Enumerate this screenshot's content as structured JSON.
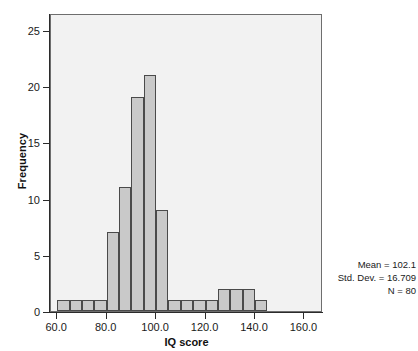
{
  "chart_data": {
    "type": "bar",
    "title": "",
    "subtitle": "",
    "xlabel": "IQ score",
    "ylabel": "Frequency",
    "xlim": [
      57.5,
      167.5
    ],
    "ylim": [
      0,
      26.5
    ],
    "bin_width": 5,
    "grid": false,
    "legend": null,
    "x_ticks": [
      "60.0",
      "80.0",
      "100.0",
      "120.0",
      "140.0",
      "160.0"
    ],
    "x_tick_values": [
      60,
      80,
      100,
      120,
      140,
      160
    ],
    "y_ticks": [
      "0",
      "5",
      "10",
      "15",
      "20",
      "25"
    ],
    "y_tick_values": [
      0,
      5,
      10,
      15,
      20,
      25
    ],
    "bin_starts": [
      60,
      65,
      70,
      75,
      80,
      85,
      90,
      95,
      100,
      105,
      110,
      115,
      120,
      125,
      130,
      135,
      140,
      145,
      150,
      155,
      160
    ],
    "bins": [
      {
        "start": 60,
        "end": 65,
        "count": 1
      },
      {
        "start": 65,
        "end": 70,
        "count": 1
      },
      {
        "start": 70,
        "end": 75,
        "count": 1
      },
      {
        "start": 75,
        "end": 80,
        "count": 1
      },
      {
        "start": 80,
        "end": 85,
        "count": 7
      },
      {
        "start": 85,
        "end": 90,
        "count": 11
      },
      {
        "start": 90,
        "end": 95,
        "count": 19
      },
      {
        "start": 95,
        "end": 100,
        "count": 21
      },
      {
        "start": 100,
        "end": 105,
        "count": 9
      },
      {
        "start": 105,
        "end": 110,
        "count": 1
      },
      {
        "start": 110,
        "end": 115,
        "count": 1
      },
      {
        "start": 115,
        "end": 120,
        "count": 1
      },
      {
        "start": 120,
        "end": 125,
        "count": 1
      },
      {
        "start": 125,
        "end": 130,
        "count": 2
      },
      {
        "start": 130,
        "end": 135,
        "count": 2
      },
      {
        "start": 135,
        "end": 140,
        "count": 2
      },
      {
        "start": 140,
        "end": 145,
        "count": 1
      }
    ],
    "categories": [
      "60-65",
      "65-70",
      "70-75",
      "75-80",
      "80-85",
      "85-90",
      "90-95",
      "95-100",
      "100-105",
      "105-110",
      "110-115",
      "115-120",
      "120-125",
      "125-130",
      "130-135",
      "135-140",
      "140-145"
    ],
    "values": [
      1,
      1,
      1,
      1,
      7,
      11,
      19,
      21,
      9,
      1,
      1,
      1,
      1,
      2,
      2,
      2,
      1
    ],
    "colors": {
      "bar_fill": "#c9c9c9",
      "bar_edge": "#4a4a4a",
      "plot_background": "#f2f2f2",
      "frame": "#6e6e6e",
      "axis": "#2b2b2b",
      "text": "#1a1a1a",
      "page_background": "#ffffff"
    }
  },
  "annotations": {
    "stats": [
      "Mean = 102.1",
      "Std. Dev. = 16.709",
      "N = 80"
    ],
    "mean": "102.1",
    "std_dev": "16.709",
    "n": "80"
  }
}
